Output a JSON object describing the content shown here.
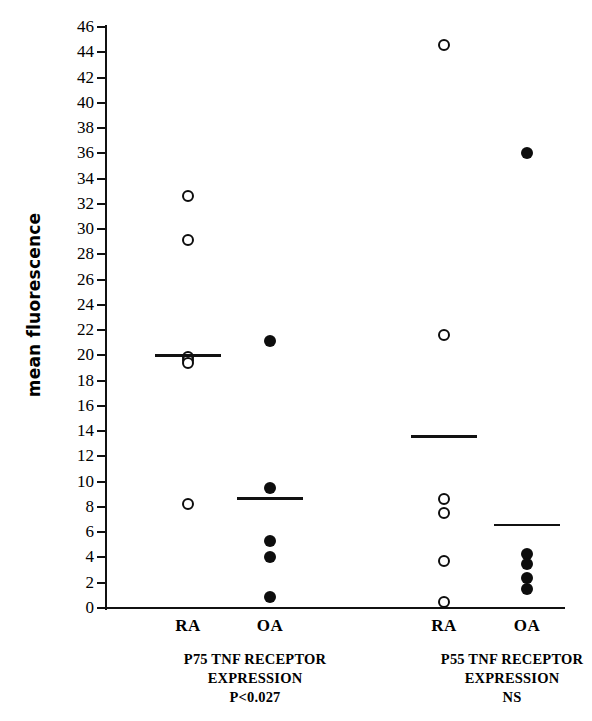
{
  "chart_data": {
    "type": "scatter",
    "title": "",
    "xlabel": "",
    "ylabel": "mean fluorescence",
    "ylim": [
      0,
      46
    ],
    "ytick_step": 2,
    "yticks": [
      0,
      2,
      4,
      6,
      8,
      10,
      12,
      14,
      16,
      18,
      20,
      22,
      24,
      26,
      28,
      30,
      32,
      34,
      36,
      38,
      40,
      42,
      44,
      46
    ],
    "grid": false,
    "legend": "none",
    "marker_styles": {
      "RA": "open-circle",
      "OA": "filled-circle"
    },
    "panels": [
      {
        "caption_line1": "P75 TNF RECEPTOR",
        "caption_line2": "EXPRESSION",
        "caption_line3": "P<0.027",
        "groups": [
          {
            "label": "RA",
            "marker": "open-circle",
            "mean": 20.0,
            "values": [
              32.6,
              29.1,
              19.9,
              19.6,
              19.4,
              8.2
            ]
          },
          {
            "label": "OA",
            "marker": "filled-circle",
            "mean": 8.7,
            "values": [
              21.1,
              9.5,
              5.3,
              4.0,
              0.9
            ]
          }
        ]
      },
      {
        "caption_line1": "P55 TNF RECEPTOR",
        "caption_line2": "EXPRESSION",
        "caption_line3": "NS",
        "groups": [
          {
            "label": "RA",
            "marker": "open-circle",
            "mean": 13.6,
            "values": [
              44.6,
              21.6,
              8.6,
              7.5,
              3.7,
              0.5
            ]
          },
          {
            "label": "OA",
            "marker": "filled-circle",
            "mean": 6.6,
            "values": [
              36.0,
              4.3,
              3.5,
              2.4,
              1.5
            ]
          }
        ]
      }
    ]
  },
  "axis": {
    "y_title": "mean fluorescence"
  }
}
